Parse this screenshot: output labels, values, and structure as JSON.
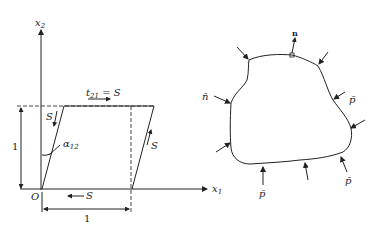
{
  "left_figure": {
    "axis_y_label": "x",
    "axis_y_sub": "2",
    "axis_x_label": "x",
    "axis_x_sub": "1",
    "origin_label": "O",
    "top_traction_label": "t",
    "top_traction_sub": "21",
    "top_traction_eq": " = S",
    "shear_left_label": "S",
    "shear_right_label": "S",
    "shear_bottom_label": "S",
    "angle_label": "α",
    "angle_sub": "12",
    "height_label": "1",
    "width_label": "1"
  },
  "right_figure": {
    "normal_top_label": "n",
    "normal_left_label": "n̄",
    "load_labels": [
      "p̄",
      "p̄",
      "p̄"
    ]
  }
}
